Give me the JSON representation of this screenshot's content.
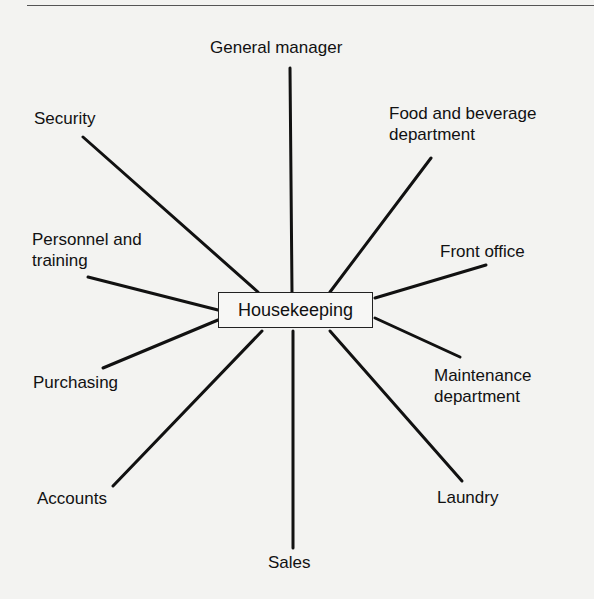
{
  "diagram": {
    "center": "Housekeeping",
    "nodes": [
      {
        "id": "general-manager",
        "label": "General manager"
      },
      {
        "id": "security",
        "label": "Security"
      },
      {
        "id": "food-beverage",
        "label": "Food and beverage department",
        "lines": [
          "Food and beverage",
          "department"
        ]
      },
      {
        "id": "personnel-training",
        "label": "Personnel and training",
        "lines": [
          "Personnel and",
          "training"
        ]
      },
      {
        "id": "front-office",
        "label": "Front office"
      },
      {
        "id": "purchasing",
        "label": "Purchasing"
      },
      {
        "id": "maintenance",
        "label": "Maintenance department",
        "lines": [
          "Maintenance",
          "department"
        ]
      },
      {
        "id": "accounts",
        "label": "Accounts"
      },
      {
        "id": "laundry",
        "label": "Laundry"
      },
      {
        "id": "sales",
        "label": "Sales"
      }
    ]
  }
}
